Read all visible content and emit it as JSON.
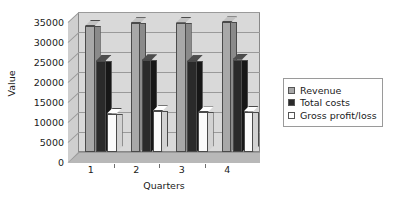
{
  "chart_data": {
    "type": "bar",
    "title": "",
    "subtitle": "",
    "xlabel": "Quarters",
    "ylabel": "Value",
    "categories": [
      "1",
      "2",
      "3",
      "4"
    ],
    "ylim": [
      0,
      35000
    ],
    "ytick_step": 5000,
    "yticks": [
      "35000",
      "30000",
      "25000",
      "20000",
      "15000",
      "10000",
      "5000",
      "0"
    ],
    "ytick_values": [
      35000,
      30000,
      25000,
      20000,
      15000,
      10000,
      5000,
      0
    ],
    "grid": true,
    "legend_position": "right",
    "style": "3d-clustered-column",
    "series": [
      {
        "name": "Revenue",
        "color": "#a8a8a8",
        "values": [
          31500,
          32200,
          32300,
          32400
        ]
      },
      {
        "name": "Total costs",
        "color": "#2a2a2a",
        "values": [
          22800,
          22900,
          22700,
          23100
        ]
      },
      {
        "name": "Gross profit/loss",
        "color": "#ffffff",
        "values": [
          9600,
          10200,
          9900,
          10100
        ]
      }
    ]
  },
  "legend": {
    "items": [
      {
        "label": "Revenue",
        "swatch": "revenue-swatch-icon"
      },
      {
        "label": "Total costs",
        "swatch": "total-costs-swatch-icon"
      },
      {
        "label": "Gross profit/loss",
        "swatch": "gross-profit-swatch-icon"
      }
    ]
  },
  "axes": {
    "y_title": "Value",
    "x_title": "Quarters"
  }
}
